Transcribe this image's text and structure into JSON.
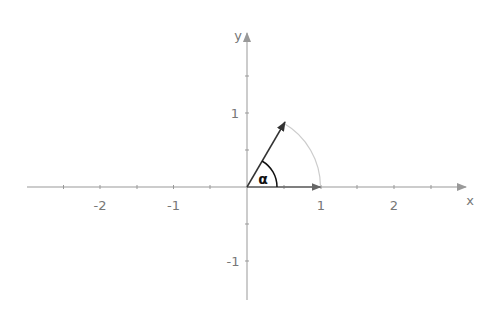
{
  "diagram": {
    "axes": {
      "x_label": "x",
      "y_label": "y",
      "x_ticks": [
        {
          "value": -2,
          "label": "-2"
        },
        {
          "value": -1,
          "label": "-1"
        },
        {
          "value": 1,
          "label": "1"
        },
        {
          "value": 2,
          "label": "2"
        }
      ],
      "y_ticks": [
        {
          "value": 1,
          "label": "1"
        },
        {
          "value": -1,
          "label": "-1"
        }
      ],
      "x_range": [
        -3,
        3
      ],
      "y_range": [
        -1.5,
        2
      ]
    },
    "vectors": [
      {
        "name": "unit-x-vector",
        "from": [
          0,
          0
        ],
        "to": [
          1,
          0
        ]
      },
      {
        "name": "rotated-vector",
        "from": [
          0,
          0
        ],
        "to": [
          0.5,
          0.866
        ],
        "angle_deg": 60
      }
    ],
    "angle_label": "α",
    "colors": {
      "axis": "#999999",
      "vector": "#333333",
      "unit_arc": "#cccccc",
      "angle_arc": "#111111",
      "text": "#777777"
    }
  }
}
